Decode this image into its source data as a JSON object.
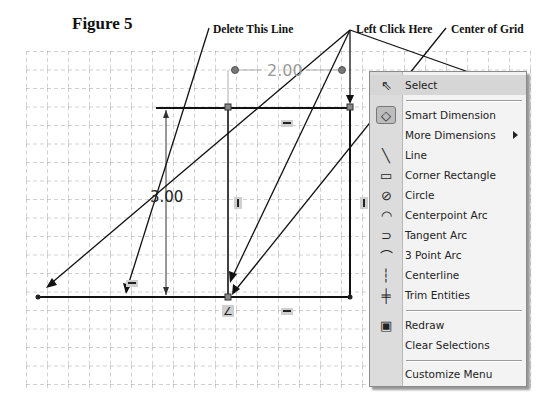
{
  "figure": {
    "title": "Figure 5"
  },
  "callouts": {
    "delete_line": "Delete This Line",
    "left_click": "Left Click Here",
    "center_grid": "Center of Grid"
  },
  "sketch": {
    "horizontal_dimension": "2.00",
    "vertical_dimension": "3.00",
    "relations": [
      "horizontal",
      "vertical",
      "vertical",
      "horizontal",
      "horizontal",
      "coincident"
    ]
  },
  "context_menu": {
    "items": [
      {
        "icon": "select-arrow-icon",
        "label": "Select",
        "highlighted": true
      },
      {
        "icon": "smart-dimension-icon",
        "label": "Smart Dimension"
      },
      {
        "icon": "none",
        "label": "More Dimensions",
        "submenu": true
      },
      {
        "icon": "line-icon",
        "label": "Line"
      },
      {
        "icon": "rectangle-icon",
        "label": "Corner Rectangle"
      },
      {
        "icon": "circle-icon",
        "label": "Circle"
      },
      {
        "icon": "centerpoint-arc-icon",
        "label": "Centerpoint Arc"
      },
      {
        "icon": "tangent-arc-icon",
        "label": "Tangent Arc"
      },
      {
        "icon": "three-point-arc-icon",
        "label": "3 Point Arc"
      },
      {
        "icon": "centerline-icon",
        "label": "Centerline"
      },
      {
        "icon": "trim-icon",
        "label": "Trim Entities"
      },
      {
        "icon": "redraw-icon",
        "label": "Redraw"
      },
      {
        "icon": "none",
        "label": "Clear Selections"
      },
      {
        "icon": "none",
        "label": "Customize Menu"
      }
    ]
  },
  "colors": {
    "grid": "#8a8a8a",
    "sketch_line": "#111111",
    "menu_bg": "#f3f3f3",
    "menu_gutter": "#dcdcdc"
  }
}
